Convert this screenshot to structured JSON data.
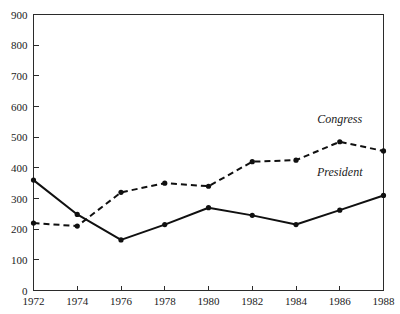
{
  "chart_data": {
    "type": "line",
    "title": "",
    "subtitle": "",
    "xlabel": "",
    "ylabel": "",
    "x": [
      1972,
      1974,
      1976,
      1978,
      1980,
      1982,
      1984,
      1986,
      1988
    ],
    "categories": [
      "1972",
      "1974",
      "1976",
      "1978",
      "1980",
      "1982",
      "1984",
      "1986",
      "1988"
    ],
    "xlim": [
      1972,
      1988
    ],
    "ylim": [
      0,
      900
    ],
    "y_ticks": [
      0,
      100,
      200,
      300,
      400,
      500,
      600,
      700,
      800,
      900
    ],
    "y_tick_labels": [
      "0",
      "100",
      "200",
      "300",
      "400",
      "500",
      "600",
      "700",
      "800",
      "900"
    ],
    "x_ticks": [
      1972,
      1974,
      1976,
      1978,
      1980,
      1982,
      1984,
      1986,
      1988
    ],
    "x_tick_labels": [
      "1972",
      "1974",
      "1976",
      "1978",
      "1980",
      "1982",
      "1984",
      "1986",
      "1988"
    ],
    "grid": false,
    "legend_position": "inline-annotation",
    "series": [
      {
        "name": "Congress",
        "style": "dashed",
        "color": "#101010",
        "marker": "filled-circle",
        "values": [
          220,
          210,
          320,
          350,
          340,
          420,
          425,
          485,
          455
        ],
        "label_x": 1986,
        "label_y": 545
      },
      {
        "name": "President",
        "style": "solid",
        "color": "#101010",
        "marker": "filled-circle",
        "values": [
          360,
          248,
          165,
          215,
          270,
          245,
          215,
          262,
          310
        ],
        "label_x": 1986,
        "label_y": 375
      }
    ],
    "annotations": [
      {
        "text": "Congress",
        "x": 1986,
        "y": 545
      },
      {
        "text": "President",
        "x": 1986,
        "y": 375
      }
    ]
  },
  "colors": {
    "axis": "#2b2b2b",
    "series": "#101010",
    "background": "#ffffff",
    "text": "#1a1a1a"
  }
}
